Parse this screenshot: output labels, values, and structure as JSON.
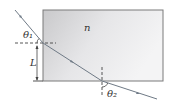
{
  "diagram": {
    "labels": {
      "index": "n",
      "theta1": "θ₁",
      "theta2": "θ₂",
      "length": "L"
    },
    "colors": {
      "slab_fill_dark": "#c9c9cb",
      "slab_fill_light": "#f2f2f3",
      "slab_border": "#7a7a7a",
      "ray": "#6f7a86",
      "dashed": "#444444",
      "text": "#333333"
    }
  }
}
